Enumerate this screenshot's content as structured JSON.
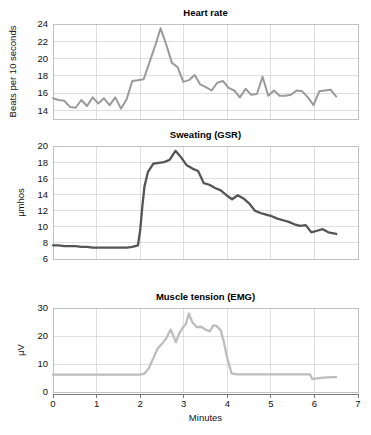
{
  "figure": {
    "x_axis_title": "Minutes",
    "x_ticks": [
      "0",
      "1",
      "2",
      "3",
      "4",
      "5",
      "6",
      "7"
    ],
    "x_range": [
      0,
      7
    ]
  },
  "chart_data": [
    {
      "type": "line",
      "title": "Heart rate",
      "xlabel": "",
      "ylabel": "Beats per 10 seconds",
      "xlim": [
        0,
        7
      ],
      "ylim": [
        13,
        24
      ],
      "yticks": [
        14,
        16,
        18,
        20,
        22,
        24
      ],
      "xticks": [
        0,
        1,
        2,
        3,
        4,
        5,
        6,
        7
      ],
      "grid": true,
      "color": "#9a9a9a",
      "line_width": 2.0,
      "x": [
        0.0,
        0.13,
        0.26,
        0.39,
        0.52,
        0.65,
        0.78,
        0.91,
        1.04,
        1.17,
        1.3,
        1.43,
        1.56,
        1.69,
        1.82,
        1.95,
        2.08,
        2.21,
        2.34,
        2.47,
        2.6,
        2.73,
        2.86,
        2.99,
        3.12,
        3.25,
        3.38,
        3.51,
        3.64,
        3.77,
        3.9,
        4.03,
        4.16,
        4.29,
        4.42,
        4.55,
        4.68,
        4.81,
        4.94,
        5.07,
        5.2,
        5.33,
        5.46,
        5.59,
        5.72,
        5.85,
        5.98,
        6.11,
        6.24,
        6.37,
        6.5
      ],
      "y": [
        15.4,
        15.2,
        15.1,
        14.4,
        14.3,
        15.2,
        14.5,
        15.5,
        14.8,
        15.4,
        14.6,
        15.5,
        14.2,
        15.3,
        17.4,
        17.5,
        17.6,
        19.5,
        21.4,
        23.5,
        21.6,
        19.5,
        19.0,
        17.3,
        17.5,
        18.1,
        17.0,
        16.7,
        16.3,
        17.2,
        17.4,
        16.6,
        16.3,
        15.5,
        16.5,
        15.8,
        15.9,
        17.9,
        15.7,
        16.3,
        15.7,
        15.7,
        15.8,
        16.3,
        16.2,
        15.5,
        14.6,
        16.2,
        16.3,
        16.4,
        15.6
      ]
    },
    {
      "type": "line",
      "title": "Sweating (GSR)",
      "xlabel": "",
      "ylabel": "μmhos",
      "xlim": [
        0,
        7
      ],
      "ylim": [
        6,
        20
      ],
      "yticks": [
        6,
        8,
        10,
        12,
        14,
        16,
        18,
        20
      ],
      "xticks": [
        0,
        1,
        2,
        3,
        4,
        5,
        6,
        7
      ],
      "grid": true,
      "color": "#555555",
      "line_width": 2.3,
      "x": [
        0.0,
        0.13,
        0.26,
        0.39,
        0.52,
        0.65,
        0.78,
        0.91,
        1.04,
        1.17,
        1.3,
        1.43,
        1.56,
        1.69,
        1.82,
        1.95,
        2.0,
        2.05,
        2.1,
        2.18,
        2.3,
        2.42,
        2.55,
        2.68,
        2.81,
        2.94,
        3.07,
        3.2,
        3.33,
        3.46,
        3.59,
        3.72,
        3.85,
        3.98,
        4.11,
        4.24,
        4.37,
        4.5,
        4.63,
        4.76,
        4.89,
        5.02,
        5.15,
        5.28,
        5.41,
        5.54,
        5.67,
        5.8,
        5.93,
        6.06,
        6.19,
        6.32,
        6.5
      ],
      "y": [
        7.7,
        7.7,
        7.6,
        7.6,
        7.6,
        7.5,
        7.5,
        7.4,
        7.4,
        7.4,
        7.4,
        7.4,
        7.4,
        7.4,
        7.5,
        7.7,
        9.5,
        12.5,
        15.0,
        16.8,
        17.8,
        17.9,
        18.0,
        18.3,
        19.4,
        18.6,
        17.6,
        17.2,
        16.9,
        15.4,
        15.2,
        14.8,
        14.5,
        13.9,
        13.4,
        13.9,
        13.5,
        12.9,
        12.0,
        11.7,
        11.5,
        11.3,
        11.0,
        10.8,
        10.6,
        10.3,
        10.1,
        10.2,
        9.3,
        9.5,
        9.7,
        9.3,
        9.1
      ]
    },
    {
      "type": "line",
      "title": "Muscle tension (EMG)",
      "xlabel": "Minutes",
      "ylabel": "μV",
      "xlim": [
        0,
        7
      ],
      "ylim": [
        0,
        30
      ],
      "yticks": [
        0,
        10,
        20,
        30
      ],
      "xticks": [
        0,
        1,
        2,
        3,
        4,
        5,
        6,
        7
      ],
      "grid": true,
      "color": "#bdbdbd",
      "line_width": 2.3,
      "x": [
        0.0,
        0.2,
        0.4,
        0.6,
        0.8,
        1.0,
        1.2,
        1.4,
        1.6,
        1.8,
        2.0,
        2.1,
        2.2,
        2.3,
        2.4,
        2.5,
        2.6,
        2.7,
        2.75,
        2.82,
        2.9,
        2.98,
        3.05,
        3.12,
        3.2,
        3.3,
        3.4,
        3.5,
        3.6,
        3.68,
        3.75,
        3.85,
        3.92,
        4.0,
        4.1,
        4.25,
        4.5,
        4.75,
        5.0,
        5.25,
        5.5,
        5.75,
        5.9,
        5.95,
        6.05,
        6.2,
        6.4,
        6.5
      ],
      "y": [
        6.2,
        6.2,
        6.2,
        6.2,
        6.2,
        6.2,
        6.2,
        6.2,
        6.2,
        6.2,
        6.2,
        6.6,
        8.5,
        12.0,
        15.5,
        17.2,
        19.2,
        22.3,
        20.5,
        17.8,
        21.0,
        23.0,
        24.3,
        28.0,
        24.8,
        23.2,
        23.3,
        22.3,
        21.7,
        23.8,
        23.6,
        22.0,
        18.0,
        12.0,
        6.6,
        6.3,
        6.3,
        6.3,
        6.3,
        6.3,
        6.3,
        6.3,
        6.3,
        4.6,
        4.9,
        5.1,
        5.3,
        5.3
      ]
    }
  ]
}
